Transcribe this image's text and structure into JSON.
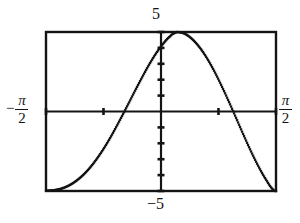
{
  "figure": {
    "name": "graphing-calculator-plot",
    "background_color": "#ffffff",
    "ink_color": "#141414"
  },
  "labels": {
    "y_max": "5",
    "y_min": "−5",
    "x_min_sign": "−",
    "x_min_numerator": "π",
    "x_min_denominator": "2",
    "x_max_numerator": "π",
    "x_max_denominator": "2"
  },
  "chart_data": {
    "type": "line",
    "title": "",
    "xlabel": "",
    "ylabel": "",
    "xlim": [
      -1.5707963,
      1.5707963
    ],
    "xlim_labels": [
      "-π/2",
      "π/2"
    ],
    "ylim": [
      -5,
      5
    ],
    "ylim_labels": [
      "-5",
      "5"
    ],
    "grid": false,
    "legend": null,
    "axes": {
      "x_axis_at_y": 0,
      "y_axis_at_x": 0,
      "x_tick_count": 4,
      "y_tick_count": 10,
      "x_ticks": [
        -1.5707963,
        -0.7853982,
        0.7853982,
        1.5707963
      ],
      "y_ticks": [
        -5,
        -4,
        -3,
        -2,
        -1,
        1,
        2,
        3,
        4,
        5
      ]
    },
    "frame": {
      "left_px": 46,
      "top_px": 32,
      "right_px": 276,
      "bottom_px": 191
    },
    "annotations": [
      {
        "text": "minimum at left edge",
        "x": -1.5707963,
        "y": -5
      },
      {
        "text": "maximum touches top frame",
        "x": 0.18,
        "y": 5
      },
      {
        "text": "zero crossing left",
        "x": -0.6,
        "y": 0
      },
      {
        "text": "zero crossing right",
        "x": 0.92,
        "y": 0
      }
    ],
    "series": [
      {
        "name": "curve",
        "style": "dotted-pixel-trace",
        "color": "#141414",
        "x": [
          -1.5707963,
          -1.4707963,
          -1.3707963,
          -1.2707963,
          -1.1707963,
          -1.0707963,
          -0.9707963,
          -0.8707963,
          -0.7707963,
          -0.6707963,
          -0.5707963,
          -0.4707963,
          -0.3707963,
          -0.2707963,
          -0.1707963,
          -0.0707963,
          0.0292037,
          0.1292037,
          0.18,
          0.2292037,
          0.3292037,
          0.4292037,
          0.5292037,
          0.6292037,
          0.7292037,
          0.8292037,
          0.9292037,
          1.0292037,
          1.1292037,
          1.2292037,
          1.3292037,
          1.4292037,
          1.5292037,
          1.5707963
        ],
        "y": [
          -4.98,
          -4.95,
          -4.86,
          -4.68,
          -4.4,
          -4.02,
          -3.53,
          -2.93,
          -2.24,
          -1.46,
          -0.61,
          0.27,
          1.17,
          2.05,
          2.89,
          3.64,
          4.27,
          4.75,
          4.93,
          5.0,
          4.88,
          4.54,
          4.02,
          3.34,
          2.52,
          1.59,
          0.59,
          -0.45,
          -1.5,
          -2.51,
          -3.44,
          -4.25,
          -4.9,
          -5.0
        ]
      }
    ]
  }
}
